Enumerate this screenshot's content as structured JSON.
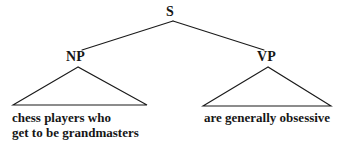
{
  "figure": {
    "kind": "syntactic-tree-diagram",
    "background_color": "#ffffff",
    "line_color": "#1a1a1a",
    "text_color": "#161616"
  },
  "tree": {
    "root": {
      "label": "S",
      "x": 173,
      "y": 13
    },
    "children": [
      {
        "label": "NP",
        "x": 78,
        "y": 58,
        "triangle": {
          "apex_x": 78,
          "apex_y": 67,
          "base_left_x": 13,
          "base_right_x": 147,
          "base_y": 105
        },
        "leaf_lines": [
          "chess players who",
          "get to be grandmasters"
        ]
      },
      {
        "label": "VP",
        "x": 268,
        "y": 58,
        "triangle": {
          "apex_x": 268,
          "apex_y": 67,
          "base_left_x": 203,
          "base_right_x": 331,
          "base_y": 106
        },
        "leaf_lines": [
          "are generally obsessive"
        ]
      }
    ]
  },
  "labels": {
    "s": "S",
    "np": "NP",
    "vp": "VP"
  },
  "leaves": {
    "np_line_1": "chess players who",
    "np_line_2": "get to be grandmasters",
    "vp_line_1": "are generally obsessive"
  }
}
